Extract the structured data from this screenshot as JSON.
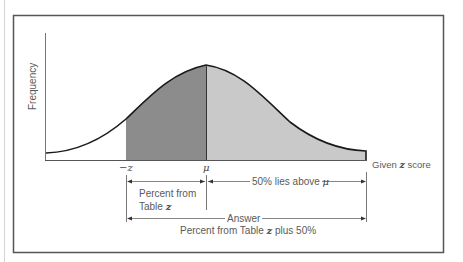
{
  "figure": {
    "y_axis_label": "Frequency",
    "x_axis_end_label_pre": "Given ",
    "x_axis_end_label_var": "z",
    "x_axis_end_label_post": " score",
    "tick_neg_z": "−z",
    "tick_mu": "μ",
    "bracket_left_line1": "Percent from",
    "bracket_left_line2_pre": "Table ",
    "bracket_left_line2_var": "z",
    "bracket_right_pre": "50% lies above ",
    "bracket_right_var": "μ",
    "answer_label": "Answer",
    "answer_text_pre": "Percent from Table ",
    "answer_text_var": "z",
    "answer_text_post": " plus 50%"
  },
  "colors": {
    "dark_region": "#8c8c8c",
    "light_region": "#c9c9c9",
    "curve": "#1a1a1a",
    "frame": "#555555"
  }
}
